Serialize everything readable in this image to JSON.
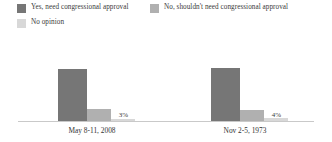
{
  "legend": {
    "position": "top-left",
    "items": [
      {
        "label": "Yes, need congressional approval",
        "color": "#767676",
        "icon": "legend-swatch-icon"
      },
      {
        "label": "No, shouldn't need congressional approval",
        "color": "#b0b0b0",
        "icon": "legend-swatch-icon"
      },
      {
        "label": "No opinion",
        "color": "#d8d8d8",
        "icon": "legend-swatch-icon"
      }
    ]
  },
  "chart_data": {
    "type": "bar",
    "title": "",
    "subtitle": "",
    "xlabel": "",
    "ylabel": "",
    "ylim": [
      0,
      100
    ],
    "grid": false,
    "legend_position": "top-left",
    "categories": [
      "May 8-11, 2008",
      "Nov 2-5, 1973"
    ],
    "series": [
      {
        "name": "Yes, need congressional approval",
        "color": "#767676",
        "values": [
          79,
          80
        ],
        "labels": [
          "79%",
          "80%"
        ]
      },
      {
        "name": "No, shouldn't need congressional approval",
        "color": "#b0b0b0",
        "values": [
          18,
          16
        ],
        "labels": [
          "18%",
          "16%"
        ]
      },
      {
        "name": "No opinion",
        "color": "#d8d8d8",
        "values": [
          3,
          4
        ],
        "labels": [
          "3%",
          "4%"
        ]
      }
    ]
  },
  "groups": [
    {
      "label": "May 8-11, 2008",
      "bars": [
        {
          "value_label": "79%",
          "height_pct": 79,
          "color": "#767676"
        },
        {
          "value_label": "18%",
          "height_pct": 18,
          "color": "#b0b0b0"
        },
        {
          "value_label": "3%",
          "height_pct": 3,
          "color": "#d8d8d8"
        }
      ]
    },
    {
      "label": "Nov 2-5, 1973",
      "bars": [
        {
          "value_label": "80%",
          "height_pct": 80,
          "color": "#767676"
        },
        {
          "value_label": "16%",
          "height_pct": 16,
          "color": "#b0b0b0"
        },
        {
          "value_label": "4%",
          "height_pct": 4,
          "color": "#d8d8d8"
        }
      ]
    }
  ],
  "axis": {
    "baseline_color": "#c9c9c9"
  }
}
